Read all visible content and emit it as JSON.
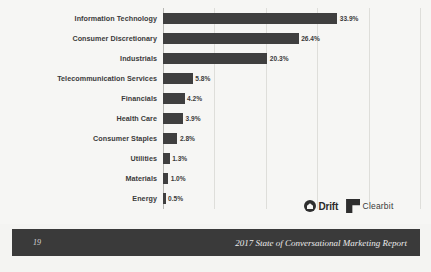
{
  "chart_data": {
    "type": "bar",
    "orientation": "horizontal",
    "title": "",
    "xlabel": "",
    "ylabel": "",
    "grid": true,
    "legend": "none",
    "xlim": [
      0,
      50
    ],
    "gridline_values": [
      0,
      10,
      20,
      30,
      40,
      50
    ],
    "categories": [
      "Information Technology",
      "Consumer Discretionary",
      "Industrials",
      "Telecommunication Services",
      "Financials",
      "Health Care",
      "Consumer Staples",
      "Utilities",
      "Materials",
      "Energy"
    ],
    "values": [
      33.9,
      26.4,
      20.3,
      5.8,
      4.2,
      3.9,
      2.8,
      1.3,
      1.0,
      0.5
    ],
    "value_labels": [
      "33.9%",
      "26.4%",
      "20.3%",
      "5.8%",
      "4.2%",
      "3.9%",
      "2.8%",
      "1.3%",
      "1.0%",
      "0.5%"
    ],
    "bar_color": "#3f3f3f",
    "background_color": "#f6f6f4",
    "gridline_color": "#dededa"
  },
  "logos": [
    {
      "name": "drift",
      "label": "Drift",
      "icon": "drift-logo-icon"
    },
    {
      "name": "clearbit",
      "label": "Clearbit",
      "icon": "clearbit-logo-icon"
    }
  ],
  "footer": {
    "page_number": "19",
    "report_title": "2017 State of Conversational Marketing Report",
    "background_color": "#3a3a3a",
    "text_color": "#ececec"
  }
}
